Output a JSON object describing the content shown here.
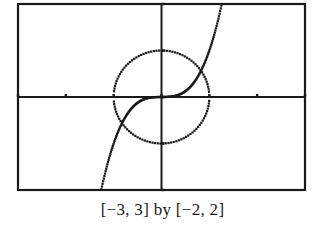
{
  "chart_data": {
    "type": "line",
    "title": "",
    "caption": "[−3, 3]  by  [−2, 2]",
    "xlim": [
      -3,
      3
    ],
    "ylim": [
      -2,
      2
    ],
    "xlabel": "",
    "ylabel": "",
    "grid": false,
    "x_ticks": [
      -3,
      -2,
      -1,
      0,
      1,
      2,
      3
    ],
    "y_ticks": [
      -2,
      -1,
      0,
      1,
      2
    ],
    "series": [
      {
        "name": "unit circle x^2 + y^2 = 1",
        "style": "dotted-pixel",
        "kind": "circle",
        "radius": 1
      },
      {
        "name": "curve y = x^3",
        "style": "dotted-pixel",
        "kind": "function",
        "expr": "x^3"
      }
    ]
  },
  "frame": {
    "left": 18,
    "top": 4,
    "right": 305,
    "bottom": 190
  },
  "colors": {
    "ink": "#1a1a1a",
    "background": "#ffffff"
  }
}
